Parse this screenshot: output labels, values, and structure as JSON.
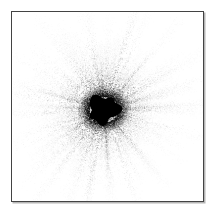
{
  "figure": {
    "title": "",
    "background_color": "#ffffff",
    "border_color": "#434343",
    "shadow_color": "#787878",
    "canvas_width": 217,
    "canvas_height": 217
  },
  "plot": {
    "frame": {
      "left": 11,
      "top": 11,
      "width": 193,
      "height": 191
    },
    "axes_visible": false,
    "tick_labels_visible": false,
    "gridlines": false
  },
  "chart_data": {
    "type": "scatter",
    "title": "",
    "subtitle": "",
    "xlabel": "",
    "ylabel": "",
    "xlim": [
      -1,
      1
    ],
    "ylim": [
      -1,
      1
    ],
    "grid": false,
    "legend": null,
    "annotations": [],
    "center": {
      "x": 0.48,
      "y": 0.515
    },
    "core": {
      "radius": 0.075,
      "color": "#000000",
      "opacity": 1.0
    },
    "point_color": "#000000",
    "point_count": 26000,
    "ray_count": 210,
    "series": [
      {
        "name": "burst-rays",
        "rays": [
          {
            "angle_deg": 2,
            "length": 0.52,
            "weight": 0.55,
            "spread_deg": 1.4
          },
          {
            "angle_deg": 7,
            "length": 0.3,
            "weight": 0.35,
            "spread_deg": 1.2
          },
          {
            "angle_deg": 13,
            "length": 0.46,
            "weight": 0.6,
            "spread_deg": 1.6
          },
          {
            "angle_deg": 19,
            "length": 0.62,
            "weight": 0.4,
            "spread_deg": 1.0
          },
          {
            "angle_deg": 25,
            "length": 0.34,
            "weight": 0.5,
            "spread_deg": 1.5
          },
          {
            "angle_deg": 31,
            "length": 0.55,
            "weight": 0.45,
            "spread_deg": 1.3
          },
          {
            "angle_deg": 38,
            "length": 0.4,
            "weight": 0.62,
            "spread_deg": 1.7
          },
          {
            "angle_deg": 44,
            "length": 0.28,
            "weight": 0.38,
            "spread_deg": 1.1
          },
          {
            "angle_deg": 51,
            "length": 0.5,
            "weight": 0.55,
            "spread_deg": 1.5
          },
          {
            "angle_deg": 58,
            "length": 0.36,
            "weight": 0.48,
            "spread_deg": 1.4
          },
          {
            "angle_deg": 65,
            "length": 0.45,
            "weight": 0.66,
            "spread_deg": 1.8
          },
          {
            "angle_deg": 72,
            "length": 0.58,
            "weight": 0.52,
            "spread_deg": 1.3
          },
          {
            "angle_deg": 79,
            "length": 0.33,
            "weight": 0.44,
            "spread_deg": 1.2
          },
          {
            "angle_deg": 86,
            "length": 0.49,
            "weight": 0.58,
            "spread_deg": 1.6
          },
          {
            "angle_deg": 93,
            "length": 0.41,
            "weight": 0.5,
            "spread_deg": 1.4
          },
          {
            "angle_deg": 100,
            "length": 0.54,
            "weight": 0.6,
            "spread_deg": 1.5
          },
          {
            "angle_deg": 107,
            "length": 0.31,
            "weight": 0.4,
            "spread_deg": 1.1
          },
          {
            "angle_deg": 114,
            "length": 0.47,
            "weight": 0.56,
            "spread_deg": 1.6
          },
          {
            "angle_deg": 121,
            "length": 0.38,
            "weight": 0.46,
            "spread_deg": 1.3
          },
          {
            "angle_deg": 128,
            "length": 0.52,
            "weight": 0.54,
            "spread_deg": 1.5
          },
          {
            "angle_deg": 135,
            "length": 0.29,
            "weight": 0.36,
            "spread_deg": 1.0
          },
          {
            "angle_deg": 142,
            "length": 0.44,
            "weight": 0.62,
            "spread_deg": 1.7
          },
          {
            "angle_deg": 149,
            "length": 0.57,
            "weight": 0.42,
            "spread_deg": 1.2
          },
          {
            "angle_deg": 156,
            "length": 0.35,
            "weight": 0.5,
            "spread_deg": 1.4
          },
          {
            "angle_deg": 163,
            "length": 0.48,
            "weight": 0.58,
            "spread_deg": 1.6
          },
          {
            "angle_deg": 170,
            "length": 0.6,
            "weight": 0.44,
            "spread_deg": 1.2
          },
          {
            "angle_deg": 177,
            "length": 0.39,
            "weight": 0.52,
            "spread_deg": 1.5
          },
          {
            "angle_deg": 184,
            "length": 0.51,
            "weight": 0.6,
            "spread_deg": 1.6
          },
          {
            "angle_deg": 191,
            "length": 0.32,
            "weight": 0.38,
            "spread_deg": 1.1
          },
          {
            "angle_deg": 198,
            "length": 0.46,
            "weight": 0.56,
            "spread_deg": 1.5
          },
          {
            "angle_deg": 205,
            "length": 0.56,
            "weight": 0.48,
            "spread_deg": 1.3
          },
          {
            "angle_deg": 212,
            "length": 0.37,
            "weight": 0.54,
            "spread_deg": 1.4
          },
          {
            "angle_deg": 219,
            "length": 0.5,
            "weight": 0.64,
            "spread_deg": 1.8
          },
          {
            "angle_deg": 226,
            "length": 0.42,
            "weight": 0.46,
            "spread_deg": 1.2
          },
          {
            "angle_deg": 233,
            "length": 0.59,
            "weight": 0.52,
            "spread_deg": 1.5
          },
          {
            "angle_deg": 240,
            "length": 0.3,
            "weight": 0.4,
            "spread_deg": 1.1
          },
          {
            "angle_deg": 247,
            "length": 0.53,
            "weight": 0.58,
            "spread_deg": 1.6
          },
          {
            "angle_deg": 254,
            "length": 0.43,
            "weight": 0.5,
            "spread_deg": 1.4
          },
          {
            "angle_deg": 261,
            "length": 0.61,
            "weight": 0.44,
            "spread_deg": 1.2
          },
          {
            "angle_deg": 268,
            "length": 0.36,
            "weight": 0.56,
            "spread_deg": 1.5
          },
          {
            "angle_deg": 275,
            "length": 0.49,
            "weight": 0.62,
            "spread_deg": 1.7
          },
          {
            "angle_deg": 282,
            "length": 0.33,
            "weight": 0.42,
            "spread_deg": 1.2
          },
          {
            "angle_deg": 289,
            "length": 0.55,
            "weight": 0.54,
            "spread_deg": 1.5
          },
          {
            "angle_deg": 296,
            "length": 0.4,
            "weight": 0.48,
            "spread_deg": 1.3
          },
          {
            "angle_deg": 303,
            "length": 0.27,
            "weight": 0.34,
            "spread_deg": 1.0
          },
          {
            "angle_deg": 310,
            "length": 0.45,
            "weight": 0.5,
            "spread_deg": 1.4
          },
          {
            "angle_deg": 317,
            "length": 0.31,
            "weight": 0.38,
            "spread_deg": 1.1
          },
          {
            "angle_deg": 324,
            "length": 0.38,
            "weight": 0.44,
            "spread_deg": 1.3
          },
          {
            "angle_deg": 331,
            "length": 0.26,
            "weight": 0.32,
            "spread_deg": 1.0
          },
          {
            "angle_deg": 338,
            "length": 0.35,
            "weight": 0.4,
            "spread_deg": 1.2
          },
          {
            "angle_deg": 345,
            "length": 0.48,
            "weight": 0.46,
            "spread_deg": 1.3
          },
          {
            "angle_deg": 352,
            "length": 0.29,
            "weight": 0.36,
            "spread_deg": 1.1
          },
          {
            "angle_deg": 358,
            "length": 0.42,
            "weight": 0.5,
            "spread_deg": 1.4
          }
        ]
      }
    ]
  }
}
